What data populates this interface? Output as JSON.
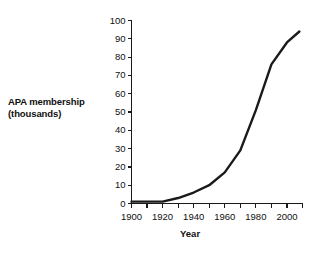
{
  "chart_data": {
    "type": "line",
    "title": "",
    "xlabel": "Year",
    "ylabel": "APA membership (thousands)",
    "xlim": [
      1900,
      2010
    ],
    "ylim": [
      0,
      100
    ],
    "grid": false,
    "legend": "none",
    "xticks": [
      1900,
      1920,
      1940,
      1960,
      1980,
      2000
    ],
    "xticks_minor": [
      1910,
      1930,
      1950,
      1970,
      1990,
      2010
    ],
    "yticks": [
      0,
      10,
      20,
      30,
      40,
      50,
      60,
      70,
      80,
      90,
      100
    ],
    "xtick_labels": [
      "1900",
      "1920",
      "1940",
      "1960",
      "1980",
      "2000"
    ],
    "ytick_labels": [
      "0",
      "10",
      "20",
      "30",
      "40",
      "50",
      "60",
      "70",
      "80",
      "90",
      "100"
    ],
    "series": [
      {
        "name": "APA membership",
        "color": "#1a1a1a",
        "x": [
          1900,
          1910,
          1920,
          1930,
          1940,
          1950,
          1960,
          1970,
          1980,
          1990,
          2000,
          2008
        ],
        "values": [
          1,
          1,
          1,
          3,
          6,
          10,
          17,
          29,
          51,
          76,
          88,
          94
        ]
      }
    ]
  },
  "axes": {
    "y_title_line1": "APA membership",
    "y_title_line2": "(thousands)",
    "x_title": "Year"
  }
}
